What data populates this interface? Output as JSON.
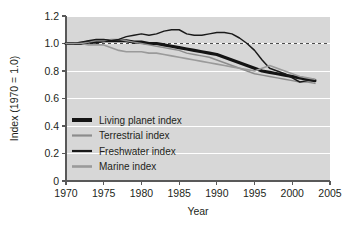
{
  "chart_data": {
    "type": "line",
    "title": "",
    "xlabel": "Year",
    "ylabel": "Index (1970 = 1.0)",
    "xlim": [
      1970,
      2005
    ],
    "ylim": [
      0,
      1.2
    ],
    "xticks": [
      1970,
      1975,
      1980,
      1985,
      1990,
      1995,
      2000,
      2005
    ],
    "xtick_labels": [
      "1970",
      "1975",
      "1980",
      "1985",
      "1990",
      "1995",
      "2000",
      "2005"
    ],
    "yticks": [
      0,
      0.2,
      0.4,
      0.6,
      0.8,
      1.0,
      1.2
    ],
    "ytick_labels": [
      "0",
      "0.2",
      "0.4",
      "0.6",
      "0.8",
      "1.0",
      "1.2"
    ],
    "grid": "horizontal-white",
    "plot_background": "#d7d7d7",
    "page_background": "#ffffff",
    "reference_line": {
      "y": 1.0,
      "style": "dashed",
      "color": "#4d4d4d"
    },
    "legend_position": "inside-lower-left",
    "x": [
      1970,
      1971,
      1972,
      1973,
      1974,
      1975,
      1976,
      1977,
      1978,
      1979,
      1980,
      1981,
      1982,
      1983,
      1984,
      1985,
      1986,
      1987,
      1988,
      1989,
      1990,
      1991,
      1992,
      1993,
      1994,
      1995,
      1996,
      1997,
      1998,
      1999,
      2000,
      2001,
      2002,
      2003
    ],
    "series": [
      {
        "name": "Living planet index",
        "color": "#141414",
        "width": 3.2,
        "values": [
          1.0,
          1.0,
          1.0,
          1.01,
          1.01,
          1.02,
          1.02,
          1.02,
          1.02,
          1.01,
          1.01,
          1.0,
          1.0,
          0.99,
          0.98,
          0.97,
          0.96,
          0.95,
          0.94,
          0.93,
          0.92,
          0.9,
          0.88,
          0.86,
          0.84,
          0.82,
          0.8,
          0.79,
          0.78,
          0.77,
          0.76,
          0.75,
          0.74,
          0.73
        ]
      },
      {
        "name": "Terrestrial index",
        "color": "#8c8c8c",
        "width": 1.5,
        "values": [
          1.0,
          1.0,
          1.01,
          1.01,
          1.02,
          1.02,
          1.03,
          1.03,
          1.02,
          1.01,
          1.0,
          0.99,
          0.98,
          0.97,
          0.96,
          0.95,
          0.93,
          0.92,
          0.91,
          0.9,
          0.88,
          0.86,
          0.84,
          0.82,
          0.8,
          0.78,
          0.77,
          0.76,
          0.75,
          0.74,
          0.73,
          0.72,
          0.72,
          0.71
        ]
      },
      {
        "name": "Freshwater index",
        "color": "#1a1a1a",
        "width": 1.5,
        "values": [
          1.0,
          1.0,
          1.01,
          1.02,
          1.03,
          1.03,
          1.02,
          1.03,
          1.05,
          1.06,
          1.07,
          1.06,
          1.07,
          1.09,
          1.1,
          1.1,
          1.07,
          1.06,
          1.06,
          1.07,
          1.08,
          1.08,
          1.07,
          1.04,
          1.0,
          0.95,
          0.88,
          0.82,
          0.8,
          0.78,
          0.75,
          0.72,
          0.73,
          0.73
        ]
      },
      {
        "name": "Marine index",
        "color": "#9a9a9a",
        "width": 1.6,
        "values": [
          1.0,
          1.0,
          1.0,
          0.99,
          0.99,
          0.99,
          0.97,
          0.95,
          0.94,
          0.94,
          0.94,
          0.93,
          0.93,
          0.92,
          0.91,
          0.9,
          0.89,
          0.88,
          0.87,
          0.86,
          0.85,
          0.84,
          0.83,
          0.82,
          0.81,
          0.8,
          0.82,
          0.84,
          0.82,
          0.8,
          0.78,
          0.76,
          0.75,
          0.74
        ]
      }
    ]
  },
  "legend": {
    "items": [
      {
        "label": "Living planet index"
      },
      {
        "label": "Terrestrial index"
      },
      {
        "label": "Freshwater index"
      },
      {
        "label": "Marine index"
      }
    ]
  }
}
